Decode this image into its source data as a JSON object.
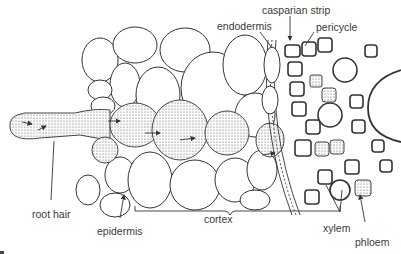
{
  "figure": {
    "labels": {
      "casparian_strip": "casparian strip",
      "endodermis": "endodermis",
      "pericycle": "pericycle",
      "root_hair": "root hair",
      "epidermis": "epidermis",
      "cortex": "cortex",
      "xylem": "xylem",
      "phloem": "phloem"
    },
    "colors": {
      "line": "#333333",
      "label_text": "#3a3a3a",
      "background": "#ffffff"
    }
  }
}
